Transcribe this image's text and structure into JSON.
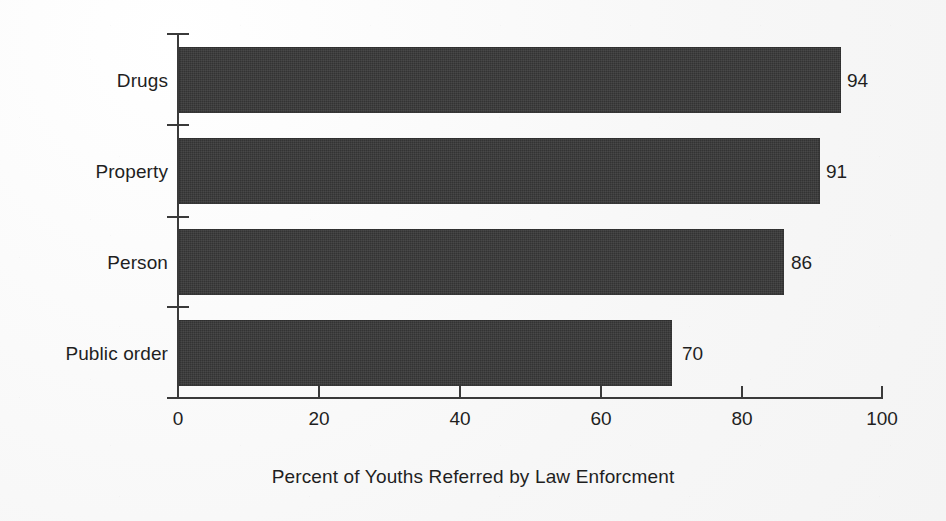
{
  "chart_data": {
    "type": "bar",
    "orientation": "horizontal",
    "title": "",
    "xlabel": "Percent of Youths Referred by Law Enforcment",
    "ylabel": "",
    "categories": [
      "Drugs",
      "Property",
      "Person",
      "Public order"
    ],
    "values": [
      94,
      91,
      86,
      70
    ],
    "value_labels": [
      "94",
      "91",
      "86",
      "70"
    ],
    "xlim": [
      0,
      100
    ],
    "xticks": [
      0,
      20,
      40,
      60,
      80,
      100
    ],
    "xtick_labels": [
      "0",
      "20",
      "40",
      "60",
      "80",
      "100"
    ],
    "grid": false,
    "legend": false,
    "bar_color": "#333333",
    "axis_color": "#3a3a3a",
    "background_color": "#fbfbfb",
    "text_color": "#1f1f1f"
  },
  "axis": {
    "title": "Percent of Youths Referred by Law Enforcment"
  },
  "categories": {
    "c0": "Drugs",
    "c1": "Property",
    "c2": "Person",
    "c3": "Public order"
  },
  "values": {
    "v0": "94",
    "v1": "91",
    "v2": "86",
    "v3": "70"
  },
  "xticks": {
    "t0": "0",
    "t1": "20",
    "t2": "40",
    "t3": "60",
    "t4": "80",
    "t5": "100"
  }
}
